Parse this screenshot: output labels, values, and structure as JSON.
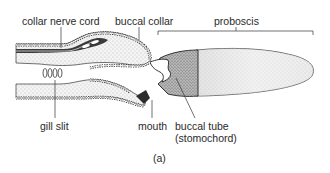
{
  "figure": {
    "panel_label": "(a)",
    "labels": {
      "collar_nerve_cord": "collar nerve cord",
      "buccal_collar": "buccal collar",
      "proboscis": "proboscis",
      "gill_slit": "gill slit",
      "mouth": "mouth",
      "buccal_tube_line1": "buccal tube",
      "buccal_tube_line2": "(stomochord)"
    },
    "colors": {
      "ink": "#2a2a2a",
      "stipple_light": "#e9e9e9",
      "stipple_dark": "#9a9a9a",
      "background": "#ffffff"
    }
  }
}
